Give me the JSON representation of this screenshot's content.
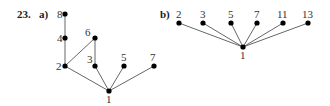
{
  "problem_number": "23.",
  "parts": [
    {
      "label": "a)",
      "nodes": [
        {
          "id": "8",
          "x": 65,
          "y": 14,
          "lx": 57,
          "ly": 18
        },
        {
          "id": "4",
          "x": 65,
          "y": 38,
          "lx": 57,
          "ly": 42
        },
        {
          "id": "6",
          "x": 95,
          "y": 38,
          "lx": 85,
          "ly": 36
        },
        {
          "id": "2",
          "x": 65,
          "y": 66,
          "lx": 56,
          "ly": 70
        },
        {
          "id": "3",
          "x": 95,
          "y": 66,
          "lx": 87,
          "ly": 63
        },
        {
          "id": "5",
          "x": 124,
          "y": 66,
          "lx": 121,
          "ly": 61
        },
        {
          "id": "7",
          "x": 154,
          "y": 66,
          "lx": 150,
          "ly": 61
        },
        {
          "id": "1",
          "x": 109,
          "y": 91,
          "lx": 106,
          "ly": 103
        }
      ],
      "edges": [
        [
          "8",
          "4"
        ],
        [
          "4",
          "2"
        ],
        [
          "6",
          "2"
        ],
        [
          "6",
          "3"
        ],
        [
          "2",
          "1"
        ],
        [
          "3",
          "1"
        ],
        [
          "5",
          "1"
        ],
        [
          "7",
          "1"
        ]
      ]
    },
    {
      "label": "b)",
      "nodes": [
        {
          "id": "2",
          "x": 179,
          "y": 23,
          "lx": 176,
          "ly": 18
        },
        {
          "id": "3",
          "x": 203,
          "y": 23,
          "lx": 200,
          "ly": 18
        },
        {
          "id": "5",
          "x": 231,
          "y": 23,
          "lx": 228,
          "ly": 18
        },
        {
          "id": "7",
          "x": 257,
          "y": 23,
          "lx": 254,
          "ly": 18
        },
        {
          "id": "11",
          "x": 283,
          "y": 23,
          "lx": 277,
          "ly": 18
        },
        {
          "id": "13",
          "x": 308,
          "y": 23,
          "lx": 302,
          "ly": 18
        },
        {
          "id": "1",
          "x": 243,
          "y": 47,
          "lx": 240,
          "ly": 59
        }
      ],
      "edges": [
        [
          "2",
          "1"
        ],
        [
          "3",
          "1"
        ],
        [
          "5",
          "1"
        ],
        [
          "7",
          "1"
        ],
        [
          "11",
          "1"
        ],
        [
          "13",
          "1"
        ]
      ]
    }
  ]
}
